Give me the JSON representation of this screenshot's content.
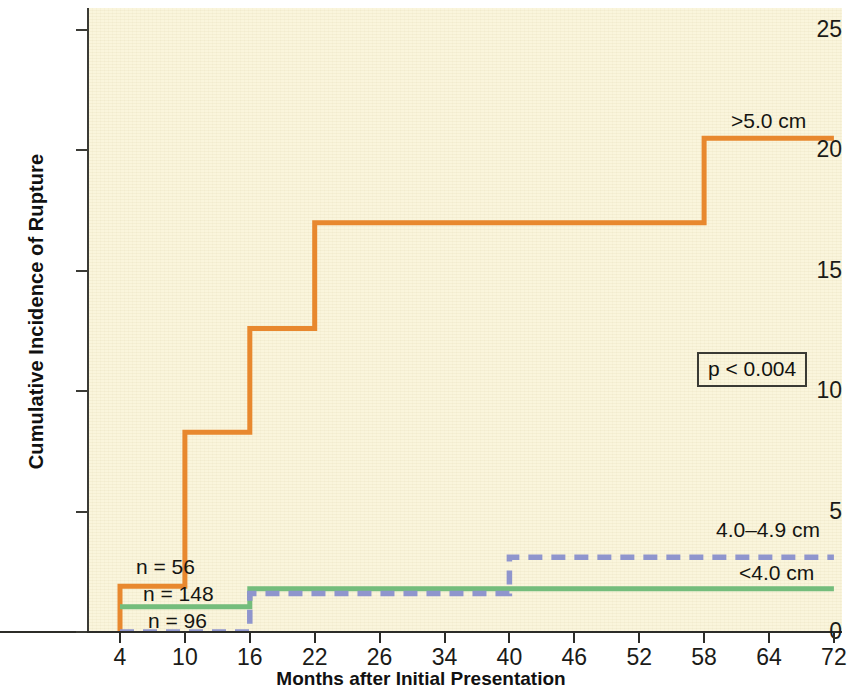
{
  "chart_data": {
    "type": "line",
    "subtype": "step-kaplan-meier-cumulative-incidence",
    "title": "",
    "xlabel": "Months after Initial Presentation",
    "ylabel": "Cumulative Incidence of Rupture",
    "xlim": [
      0,
      76
    ],
    "ylim": [
      0,
      26
    ],
    "x_ticks": [
      4,
      10,
      16,
      22,
      26,
      34,
      40,
      46,
      52,
      58,
      64,
      72
    ],
    "y_ticks": [
      0,
      5,
      10,
      15,
      20,
      25
    ],
    "grid": false,
    "legend_position": "inline-right",
    "annotations": [
      {
        "name": "p-value",
        "text": "p < 0.004",
        "boxed": true
      }
    ],
    "series": [
      {
        "name": ">5.0 cm",
        "label": ">5.0 cm",
        "n": 56,
        "n_label": "n = 56",
        "color": "#e8882e",
        "style": "solid",
        "steps": [
          {
            "month": 4,
            "value": 0.0
          },
          {
            "month": 4,
            "value": 1.9
          },
          {
            "month": 10,
            "value": 8.3
          },
          {
            "month": 16,
            "value": 12.6
          },
          {
            "month": 22,
            "value": 17.0
          },
          {
            "month": 58,
            "value": 20.5
          },
          {
            "month": 72,
            "value": 20.5
          }
        ]
      },
      {
        "name": "<4.0 cm",
        "label": "<4.0 cm",
        "n": 148,
        "n_label": "n = 148",
        "color": "#74bd7c",
        "style": "solid",
        "steps": [
          {
            "month": 4,
            "value": 1.05
          },
          {
            "month": 16,
            "value": 1.8
          },
          {
            "month": 72,
            "value": 1.8
          }
        ]
      },
      {
        "name": "4.0-4.9 cm",
        "label": "4.0–4.9 cm",
        "n": 96,
        "n_label": "n = 96",
        "color": "#8f95cd",
        "style": "dashed",
        "steps": [
          {
            "month": 4,
            "value": 0.0
          },
          {
            "month": 16,
            "value": 1.6
          },
          {
            "month": 40,
            "value": 3.1
          },
          {
            "month": 72,
            "value": 3.1
          }
        ]
      }
    ],
    "colors": {
      "plot_background": "#faf5dc",
      "axis": "#2c2c28",
      "orange": "#e8882e",
      "green": "#74bd7c",
      "blue": "#8f95cd"
    }
  }
}
